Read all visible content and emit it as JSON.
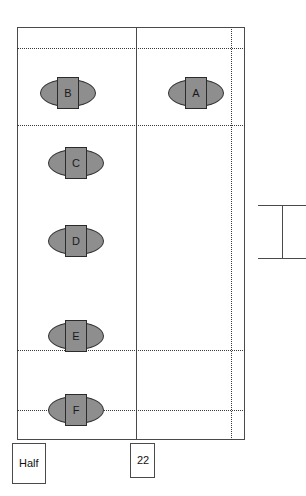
{
  "diagram": {
    "colors": {
      "line": "#4a4a4a",
      "dotted": "#3a3a3a",
      "node_fill": "#8e8e8e",
      "node_stroke": "#2b2b2b",
      "background": "#ffffff"
    },
    "frame": {
      "x": 17,
      "y": 27,
      "width": 228,
      "height": 413
    },
    "vertical_solid_lines": [
      {
        "x": 136
      }
    ],
    "vertical_dotted_lines": [
      {
        "x": 231
      }
    ],
    "horizontal_dotted_lines": [
      {
        "y": 48
      },
      {
        "y": 125
      },
      {
        "y": 350
      },
      {
        "y": 410
      }
    ],
    "nodes": [
      {
        "label": "A",
        "x": 196,
        "y": 93
      },
      {
        "label": "B",
        "x": 68,
        "y": 93
      },
      {
        "label": "C",
        "x": 76,
        "y": 163
      },
      {
        "label": "D",
        "x": 76,
        "y": 241
      },
      {
        "label": "E",
        "x": 76,
        "y": 336
      },
      {
        "label": "F",
        "x": 76,
        "y": 410
      }
    ],
    "ibeam": {
      "name": "dimension-bracket",
      "stem_x": 282,
      "stem_top": 205,
      "stem_height": 53,
      "flange_left": 258,
      "flange_width": 48,
      "flange_top_y": 205,
      "flange_bottom_y": 258
    },
    "callouts": [
      {
        "name": "half-callout",
        "text": "Half",
        "x": 12,
        "y": 443,
        "width": 34,
        "height": 41
      },
      {
        "name": "count-callout",
        "text": "22",
        "x": 130,
        "y": 443,
        "width": 25,
        "height": 35
      }
    ]
  }
}
